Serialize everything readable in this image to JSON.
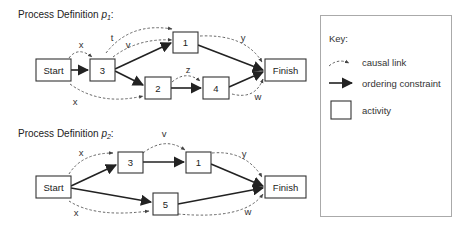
{
  "diagram1": {
    "title": "Process Definition ",
    "title_var": "p",
    "title_sub": "1",
    "title_suffix": ":",
    "nodes": {
      "start": "Start",
      "a3": "3",
      "a1": "1",
      "a2": "2",
      "a4": "4",
      "finish": "Finish"
    },
    "causal_labels": {
      "start_3": "x",
      "start_2": "x",
      "three_1_t": "t",
      "three_1_v": "v",
      "two_4": "z",
      "one_finish": "y",
      "four_finish": "w"
    }
  },
  "diagram2": {
    "title": "Process Definition ",
    "title_var": "p",
    "title_sub": "2",
    "title_suffix": ":",
    "nodes": {
      "start": "Start",
      "a3": "3",
      "a1": "1",
      "a5": "5",
      "finish": "Finish"
    },
    "causal_labels": {
      "start_3": "x",
      "start_5": "x",
      "three_1": "v",
      "one_finish": "y",
      "five_finish": "w"
    }
  },
  "key": {
    "title": "Key:",
    "items": [
      {
        "symbol": "causal-link",
        "label": "causal link"
      },
      {
        "symbol": "ordering-constraint",
        "label": "ordering constraint"
      },
      {
        "symbol": "activity",
        "label": "activity"
      }
    ]
  }
}
